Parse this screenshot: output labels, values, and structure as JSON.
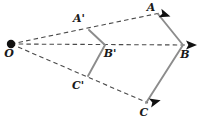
{
  "figure": {
    "kind": "geometry-diagram",
    "width": 204,
    "height": 118,
    "background_color": "#ffffff",
    "solid_stroke_color": "#8c8c8c",
    "dashed_stroke_color": "#4a4a4a",
    "label_color": "#1a1a1a",
    "point_color": "#111111"
  },
  "center": {
    "name": "O",
    "label": "O",
    "x": 11,
    "y": 44,
    "label_x": 9,
    "label_y": 57,
    "dot_radius": 4.2
  },
  "preimage": {
    "name": "A'B'C'",
    "points": [
      {
        "name": "A'",
        "label": "A'",
        "x": 89,
        "y": 30,
        "label_x": 79,
        "label_y": 22
      },
      {
        "name": "B'",
        "label": "B'",
        "x": 105,
        "y": 45,
        "label_x": 107,
        "label_y": 57
      },
      {
        "name": "C'",
        "label": "C'",
        "x": 88,
        "y": 76,
        "label_x": 76,
        "label_y": 89
      }
    ]
  },
  "image_shape": {
    "name": "ABC",
    "points": [
      {
        "name": "A",
        "label": "A",
        "x": 158,
        "y": 14,
        "label_x": 150,
        "label_y": 10
      },
      {
        "name": "B",
        "label": "B",
        "x": 183,
        "y": 45,
        "label_x": 183,
        "label_y": 58
      },
      {
        "name": "C",
        "label": "C",
        "x": 146,
        "y": 103,
        "label_x": 142,
        "label_y": 116
      }
    ]
  },
  "rays": [
    {
      "name": "ray-O-A",
      "from": "O",
      "through": "A'",
      "to": "A",
      "x1": 11,
      "y1": 44,
      "x2": 160,
      "y2": 13
    },
    {
      "name": "ray-O-B",
      "from": "O",
      "through": "B'",
      "to": "B",
      "x1": 11,
      "y1": 44,
      "x2": 186,
      "y2": 45
    },
    {
      "name": "ray-O-C",
      "from": "O",
      "through": "C'",
      "to": "C",
      "x1": 11,
      "y1": 44,
      "x2": 148,
      "y2": 103
    }
  ],
  "arrowheads": [
    {
      "name": "arrowhead-A",
      "at": "A",
      "x": 164,
      "y": 15,
      "angle": 18
    },
    {
      "name": "arrowhead-B",
      "at": "B",
      "x": 192,
      "y": 45,
      "angle": 0
    },
    {
      "name": "arrowhead-C",
      "at": "C",
      "x": 155,
      "y": 103,
      "angle": -14
    }
  ]
}
